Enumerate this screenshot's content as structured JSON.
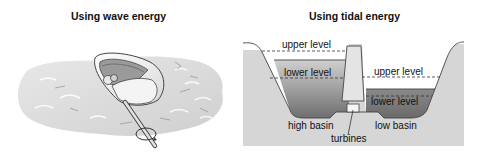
{
  "wave_panel": {
    "title": "Using wave energy",
    "icons": [
      "wave-energy-device-icon",
      "rotation-arrow-icon"
    ]
  },
  "tidal_panel": {
    "title": "Using tidal energy",
    "labels": {
      "high_upper": "upper level",
      "high_lower": "lower level",
      "low_upper": "upper level",
      "low_lower": "lower level",
      "high_basin": "high basin",
      "low_basin": "low basin",
      "turbines": "turbines"
    }
  },
  "colors": {
    "ground": "#d6d6d6",
    "water_dark": "#7a7a7a",
    "water_light": "#c8c8c8",
    "dam": "#e6e6e6",
    "outline": "#333333"
  }
}
